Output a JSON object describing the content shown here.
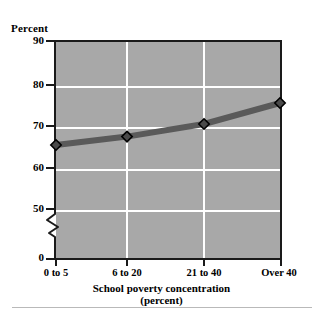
{
  "chart_data": {
    "type": "line",
    "title": "",
    "xlabel": "School poverty concentration (percent)",
    "ylabel": "Percent",
    "categories": [
      "0 to 5",
      "6 to 20",
      "21 to 40",
      "Over 40"
    ],
    "values": [
      65,
      67,
      70,
      75
    ],
    "series": [
      {
        "name": "Percent",
        "values": [
          65,
          67,
          70,
          75
        ]
      }
    ],
    "ylim": [
      0,
      90
    ],
    "y_ticks": [
      0,
      50,
      60,
      70,
      80,
      90
    ],
    "y_axis_break": true,
    "y_axis_break_between": [
      0,
      50
    ],
    "grid": true,
    "grid_axis": "both",
    "legend": "none",
    "marker": "diamond",
    "plot_background_color": "#a8a8a8",
    "gridline_color": "#ffffff",
    "series_color": "#5a5a5a",
    "marker_fill_color": "#4a4a4a",
    "marker_edge_color": "#000000",
    "axis_color": "#1a1a1a"
  },
  "axes": {
    "y_title": "Percent",
    "y_tick_labels": [
      "90",
      "80",
      "70",
      "60",
      "50",
      "0"
    ],
    "x_tick_labels": [
      "0 to 5",
      "6 to 20",
      "21 to 40",
      "Over 40"
    ],
    "x_title_line1": "School poverty concentration",
    "x_title_line2": "(percent)"
  }
}
